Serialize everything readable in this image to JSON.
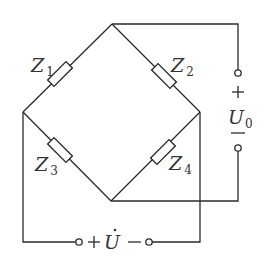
{
  "diagram": {
    "type": "bridge circuit",
    "impedances": [
      {
        "name": "Z",
        "sub": "1",
        "branch": "left-node to top-node"
      },
      {
        "name": "Z",
        "sub": "2",
        "branch": "top-node to right-node"
      },
      {
        "name": "Z",
        "sub": "3",
        "branch": "left-node to bottom-node"
      },
      {
        "name": "Z",
        "sub": "4",
        "branch": "bottom-node to right-node"
      }
    ],
    "output": {
      "name": "U",
      "sub": "0",
      "plus": "+",
      "minus": "—"
    },
    "source": {
      "name": "U",
      "dot": "·",
      "plus": "+",
      "minus": "−"
    }
  }
}
